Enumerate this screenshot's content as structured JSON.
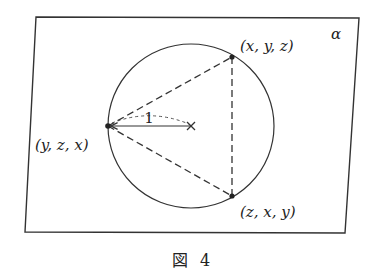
{
  "figure": {
    "plane_label": "α",
    "caption_glyph": "図",
    "caption_number": "4",
    "radius_label": "1",
    "points": [
      {
        "id": "top",
        "label": "(x, y, z)",
        "x": 232,
        "y": 57
      },
      {
        "id": "left",
        "label": "(y, z, x)",
        "x": 108,
        "y": 126
      },
      {
        "id": "bottom",
        "label": "(z, x, y)",
        "x": 232,
        "y": 196
      }
    ],
    "center": {
      "x": 191,
      "y": 126,
      "marker": "×"
    },
    "circle": {
      "cx": 191,
      "cy": 126,
      "rx": 83,
      "ry": 82
    },
    "plane": {
      "corners": [
        [
          36,
          17
        ],
        [
          359,
          18
        ],
        [
          345,
          233
        ],
        [
          25,
          232
        ]
      ]
    },
    "colors": {
      "stroke": "#333333",
      "background": "#ffffff"
    }
  }
}
